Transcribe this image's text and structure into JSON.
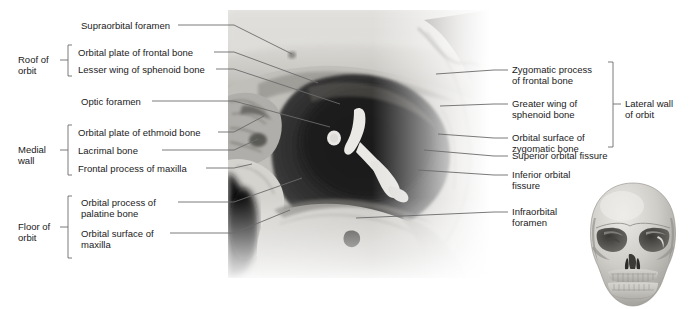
{
  "figure": {
    "image_name": "orbit-photograph",
    "inset_name": "skull-anterior-view-inset"
  },
  "colors": {
    "text": "#1a1a1a",
    "leader_line": "#6b6b6b",
    "bracket": "#6b6b6b",
    "background": "#ffffff"
  },
  "left_labels": [
    {
      "id": "supraorbital-foramen",
      "text": "Supraorbital foramen",
      "lines": [
        "Supraorbital foramen"
      ]
    },
    {
      "id": "orbital-plate-frontal-bone",
      "text": "Orbital plate of frontal bone",
      "lines": [
        "Orbital plate of frontal bone"
      ]
    },
    {
      "id": "lesser-wing-sphenoid-bone",
      "text": "Lesser wing of sphenoid bone",
      "lines": [
        "Lesser wing of sphenoid bone"
      ]
    },
    {
      "id": "optic-foramen",
      "text": "Optic foramen",
      "lines": [
        "Optic foramen"
      ]
    },
    {
      "id": "orbital-plate-ethmoid-bone",
      "text": "Orbital plate of ethmoid bone",
      "lines": [
        "Orbital plate of ethmoid bone"
      ]
    },
    {
      "id": "lacrimal-bone",
      "text": "Lacrimal bone",
      "lines": [
        "Lacrimal bone"
      ]
    },
    {
      "id": "frontal-process-maxilla",
      "text": "Frontal process of maxilla",
      "lines": [
        "Frontal process of maxilla"
      ]
    },
    {
      "id": "orbital-process-palatine-bone",
      "text": "Orbital process of palatine bone",
      "lines": [
        "Orbital process of",
        "palatine bone"
      ]
    },
    {
      "id": "orbital-surface-maxilla",
      "text": "Orbital surface of maxilla",
      "lines": [
        "Orbital surface of",
        "maxilla"
      ]
    }
  ],
  "right_labels": [
    {
      "id": "zygomatic-process-frontal-bone",
      "text": "Zygomatic process of frontal bone",
      "lines": [
        "Zygomatic process",
        "of frontal bone"
      ]
    },
    {
      "id": "greater-wing-sphenoid-bone",
      "text": "Greater wing of sphenoid bone",
      "lines": [
        "Greater wing of",
        "sphenoid bone"
      ]
    },
    {
      "id": "orbital-surface-zygomatic-bone",
      "text": "Orbital surface of zygomatic bone",
      "lines": [
        "Orbital surface of",
        "zygomatic bone"
      ]
    },
    {
      "id": "superior-orbital-fissure",
      "text": "Superior orbital fissure",
      "lines": [
        "Superior orbital fissure"
      ]
    },
    {
      "id": "inferior-orbital-fissure",
      "text": "Inferior orbital fissure",
      "lines": [
        "Inferior orbital",
        "fissure"
      ]
    },
    {
      "id": "infraorbital-foramen",
      "text": "Infraorbital foramen",
      "lines": [
        "Infraorbital",
        "foramen"
      ]
    }
  ],
  "groups": [
    {
      "id": "roof-of-orbit",
      "lines": [
        "Roof of",
        "orbit"
      ],
      "side": "left",
      "members": [
        "orbital-plate-frontal-bone",
        "lesser-wing-sphenoid-bone"
      ]
    },
    {
      "id": "medial-wall",
      "lines": [
        "Medial",
        "wall"
      ],
      "side": "left",
      "members": [
        "orbital-plate-ethmoid-bone",
        "lacrimal-bone",
        "frontal-process-maxilla"
      ]
    },
    {
      "id": "floor-of-orbit",
      "lines": [
        "Floor of",
        "orbit"
      ],
      "side": "left",
      "members": [
        "orbital-process-palatine-bone",
        "orbital-surface-maxilla"
      ]
    },
    {
      "id": "lateral-wall-of-orbit",
      "lines": [
        "Lateral wall",
        "of orbit"
      ],
      "side": "right",
      "members": [
        "zygomatic-process-frontal-bone",
        "greater-wing-sphenoid-bone",
        "orbital-surface-zygomatic-bone"
      ]
    }
  ]
}
